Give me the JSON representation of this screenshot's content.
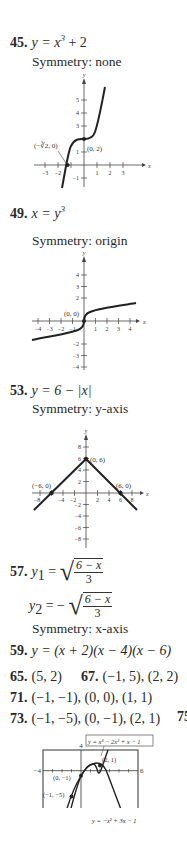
{
  "problems": {
    "p45": {
      "number": "45.",
      "equation_lhs": "y = x",
      "equation_exp": "3",
      "equation_rhs": " + 2",
      "symmetry": "Symmetry: none",
      "graph": {
        "x_label": "x",
        "y_label": "y",
        "x_ticks": [
          "−3",
          "−2",
          "1",
          "2",
          "3"
        ],
        "y_ticks": [
          "5",
          "4",
          "3",
          "1",
          "−1"
        ],
        "point_labels": [
          "(−∛2, 0)",
          "(0, 2)"
        ]
      }
    },
    "p49": {
      "number": "49.",
      "equation_lhs": "x = y",
      "equation_exp": "3",
      "symmetry": "Symmetry: origin",
      "graph": {
        "x_label": "x",
        "y_label": "y",
        "x_ticks": [
          "−4",
          "−3",
          "−2",
          "−1",
          "1",
          "2",
          "3",
          "4"
        ],
        "y_ticks": [
          "4",
          "3",
          "2",
          "−2",
          "−3",
          "−4"
        ],
        "point_labels": [
          "(0, 0)"
        ]
      }
    },
    "p53": {
      "number": "53.",
      "equation": "y = 6 − |x|",
      "symmetry": "Symmetry: y-axis",
      "graph": {
        "x_label": "x",
        "y_label": "y",
        "x_ticks": [
          "−8",
          "−4",
          "−2",
          "2",
          "4",
          "6",
          "8"
        ],
        "y_ticks": [
          "8",
          "6",
          "4",
          "2",
          "−2",
          "−4",
          "−6",
          "−8"
        ],
        "point_labels": [
          "(−6, 0)",
          "(0, 6)",
          "(6, 0)"
        ]
      }
    },
    "p57": {
      "number": "57.",
      "y1_label": "y",
      "y1_sub": "1",
      "y2_label": "y",
      "y2_sub": "2",
      "numerator": "6 − x",
      "denominator": "3",
      "eq_sign": " = ",
      "neg_eq_sign": " = − ",
      "symmetry": "Symmetry: x-axis"
    },
    "p59": {
      "number": "59.",
      "equation": "y = (x + 2)(x − 4)(x − 6)"
    },
    "p65": {
      "number": "65.",
      "answer": "(5, 2)"
    },
    "p67": {
      "number": "67.",
      "answer": "(−1, 5), (2, 2)"
    },
    "p71": {
      "number": "71.",
      "answer": "(−1, −1), (0, 0), (1, 1)"
    },
    "p73": {
      "number": "73.",
      "answer": "(−1, −5), (0, −1), (2, 1)",
      "graph": {
        "window": {
          "xmin": "−4",
          "xmax": "6",
          "ymin": "−8",
          "ymax": "4"
        },
        "curve1_label": "y = x³ − 2x² + x − 1",
        "curve2_label": "y = −x² + 3x − 1",
        "point_labels": [
          "(2, 1)",
          "(0, −1)",
          "(−1, −5)"
        ]
      }
    },
    "p75": {
      "number": "75"
    }
  }
}
